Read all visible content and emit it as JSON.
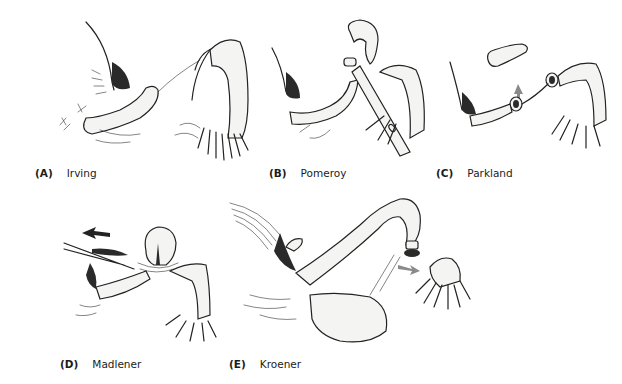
{
  "figure": {
    "panels": [
      {
        "letter": "(A)",
        "name": "Irving"
      },
      {
        "letter": "(B)",
        "name": "Pomeroy"
      },
      {
        "letter": "(C)",
        "name": "Parkland"
      },
      {
        "letter": "(D)",
        "name": "Madlener"
      },
      {
        "letter": "(E)",
        "name": "Kroener"
      }
    ]
  },
  "colors": {
    "background": "#ffffff",
    "ink": "#222222",
    "arrow_gray": "#8a8a8a",
    "arrow_dark": "#222222"
  }
}
